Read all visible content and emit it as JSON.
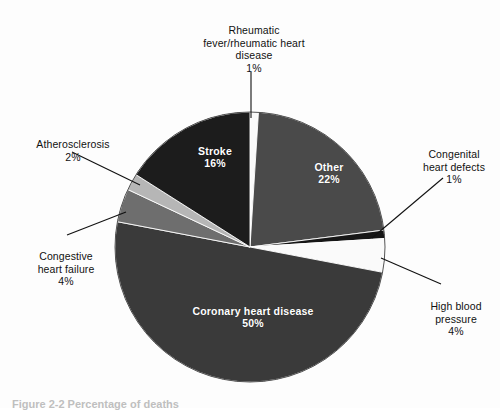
{
  "figure": {
    "caption": "Figure 2-2  Percentage of deaths",
    "background_color": "#fdfdfd"
  },
  "chart_data": {
    "type": "pie",
    "title": "",
    "legend_position": "none",
    "center": {
      "x": 250,
      "y": 247
    },
    "radius": 135,
    "start_angle_deg": 0,
    "direction": "clockwise",
    "categories": [
      "Rheumatic fever/rheumatic heart disease",
      "Other",
      "Congenital heart defects",
      "High blood pressure",
      "Coronary heart disease",
      "Congestive heart failure",
      "Atherosclerosis",
      "Stroke"
    ],
    "values": [
      1,
      22,
      1,
      4,
      50,
      4,
      2,
      16
    ],
    "value_labels": [
      "1%",
      "22%",
      "1%",
      "4%",
      "50%",
      "4%",
      "2%",
      "16%"
    ],
    "colors": [
      "#fafafa",
      "#4a4a4a",
      "#161616",
      "#fafafa",
      "#3a3a3a",
      "#6e6e6e",
      "#b6b6b6",
      "#1c1c1c"
    ],
    "slices": [
      {
        "name": "Rheumatic fever/rheumatic heart disease",
        "value": 1,
        "value_label": "1%",
        "color": "#fafafa",
        "label_placement": "callout",
        "label_text": "Rheumatic\nfever/rheumatic heart\ndisease"
      },
      {
        "name": "Other",
        "value": 22,
        "value_label": "22%",
        "color": "#4a4a4a",
        "label_placement": "inside",
        "label_text": "Other"
      },
      {
        "name": "Congenital heart defects",
        "value": 1,
        "value_label": "1%",
        "color": "#161616",
        "label_placement": "callout",
        "label_text": "Congenital\nheart defects"
      },
      {
        "name": "High blood pressure",
        "value": 4,
        "value_label": "4%",
        "color": "#fafafa",
        "label_placement": "callout",
        "label_text": "High blood\npressure"
      },
      {
        "name": "Coronary heart disease",
        "value": 50,
        "value_label": "50%",
        "color": "#3a3a3a",
        "label_placement": "inside",
        "label_text": "Coronary heart disease"
      },
      {
        "name": "Congestive heart failure",
        "value": 4,
        "value_label": "4%",
        "color": "#6e6e6e",
        "label_placement": "callout",
        "label_text": "Congestive\nheart failure"
      },
      {
        "name": "Atherosclerosis",
        "value": 2,
        "value_label": "2%",
        "color": "#b6b6b6",
        "label_placement": "callout",
        "label_text": "Atherosclerosis"
      },
      {
        "name": "Stroke",
        "value": 16,
        "value_label": "16%",
        "color": "#1c1c1c",
        "label_placement": "inside",
        "label_text": "Stroke"
      }
    ]
  },
  "labels": {
    "rheumatic": {
      "text": "Rheumatic\nfever/rheumatic heart\ndisease",
      "pct": "1%"
    },
    "atherosclerosis": {
      "text": "Atherosclerosis",
      "pct": "2%"
    },
    "congestive": {
      "text": "Congestive\nheart failure",
      "pct": "4%"
    },
    "congenital": {
      "text": "Congenital\nheart defects",
      "pct": "1%"
    },
    "highbp": {
      "text": "High blood\npressure",
      "pct": "4%"
    },
    "stroke": {
      "text": "Stroke",
      "pct": "16%"
    },
    "other": {
      "text": "Other",
      "pct": "22%"
    },
    "coronary": {
      "text": "Coronary heart disease",
      "pct": "50%"
    }
  }
}
